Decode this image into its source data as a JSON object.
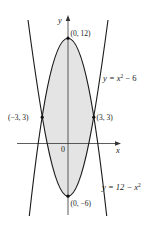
{
  "figure": {
    "axes": {
      "x_label": "x",
      "y_label": "y",
      "origin_label": "0"
    },
    "curves": [
      {
        "id": "upper-parabola",
        "equation": "y = 12 − x²",
        "label_main": "y = 12 − x",
        "label_sup": "2"
      },
      {
        "id": "lower-parabola",
        "equation": "y = x² − 6",
        "label_main": "y = x",
        "label_sup": "2",
        "label_tail": " − 6"
      }
    ],
    "points": [
      {
        "label": "(0, 12)",
        "x": 0,
        "y": 12
      },
      {
        "label": "(−3, 3)",
        "x": -3,
        "y": 3
      },
      {
        "label": "(3, 3)",
        "x": 3,
        "y": 3
      },
      {
        "label": "(0, −6)",
        "x": 0,
        "y": -6
      }
    ],
    "shaded_region": "area between y = 12 − x² and y = x² − 6",
    "colors": {
      "shade": "#e4e4e4",
      "curve": "#1a1a1a",
      "axis": "#333333"
    }
  }
}
